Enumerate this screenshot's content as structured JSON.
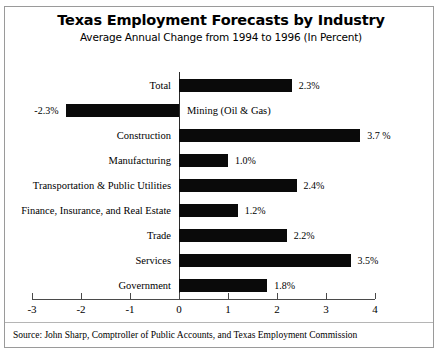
{
  "chart_data": {
    "type": "bar",
    "orientation": "horizontal",
    "title": "Texas Employment Forecasts by Industry",
    "subtitle": "Average Annual Change from 1994 to 1996 (In Percent)",
    "xlabel": "",
    "ylabel": "",
    "xlim": [
      -3,
      4
    ],
    "grid": false,
    "legend": null,
    "bar_color": "#0a0a0a",
    "axis_color": "#4a4a4a",
    "categories": [
      "Total",
      "Mining (Oil & Gas)",
      "Construction",
      "Manufacturing",
      "Transportation & Public Utilities",
      "Finance, Insurance, and Real Estate",
      "Trade",
      "Services",
      "Government"
    ],
    "values": [
      2.3,
      -2.3,
      3.7,
      1.0,
      2.4,
      1.2,
      2.2,
      3.5,
      1.8
    ],
    "value_labels": [
      "2.3%",
      "-2.3%",
      "3.7 %",
      "1.0%",
      "2.4%",
      "1.2%",
      "2.2%",
      "3.5%",
      "1.8%"
    ],
    "xticks": [
      -3,
      -2,
      -1,
      0,
      1,
      2,
      3,
      4
    ],
    "xtick_labels": [
      "-3",
      "-2",
      "-1",
      "0",
      "1",
      "2",
      "3",
      "4"
    ]
  },
  "source": {
    "text": "Source: John Sharp, Comptroller of Public Accounts, and Texas Employment Commission"
  }
}
